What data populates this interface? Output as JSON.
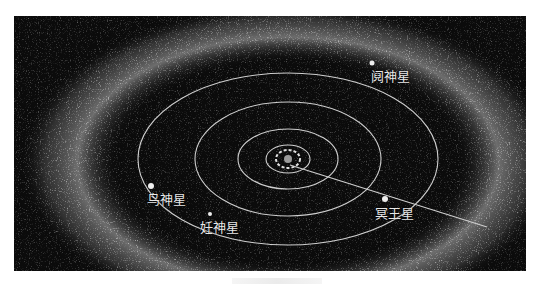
{
  "figure": {
    "colors": {
      "background": "#0b0b0b",
      "orbit": "#cfcfcf",
      "belt": "#d8d8d8",
      "label": "#e8e8e8"
    },
    "labels": [
      {
        "id": "eris",
        "text": "阋神星",
        "x": 357,
        "y": 54
      },
      {
        "id": "makemake",
        "text": "鸟神星",
        "x": 133,
        "y": 177
      },
      {
        "id": "haumea",
        "text": "妊神星",
        "x": 186,
        "y": 205
      },
      {
        "id": "pluto",
        "text": "冥王星",
        "x": 361,
        "y": 191
      }
    ]
  }
}
